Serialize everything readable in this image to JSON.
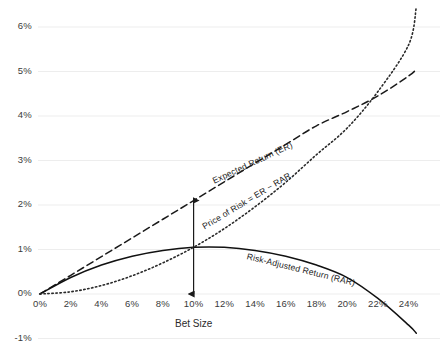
{
  "chart_data": {
    "type": "line",
    "title": "",
    "xlabel": "Bet Size",
    "ylabel": "",
    "xlim": [
      0,
      25
    ],
    "ylim": [
      -1,
      6.5
    ],
    "grid": true,
    "legend_position": "inline-curve-labels",
    "x_ticks": [
      "0%",
      "2%",
      "4%",
      "6%",
      "8%",
      "10%",
      "12%",
      "14%",
      "16%",
      "18%",
      "20%",
      "22%",
      "24%"
    ],
    "x_tick_values": [
      0,
      2,
      4,
      6,
      8,
      10,
      12,
      14,
      16,
      18,
      20,
      22,
      24
    ],
    "y_ticks": [
      "-1%",
      "0%",
      "1%",
      "2%",
      "3%",
      "4%",
      "5%",
      "6%"
    ],
    "y_tick_values": [
      -1,
      0,
      1,
      2,
      3,
      4,
      5,
      6
    ],
    "series": [
      {
        "name": "Expected Return (ER)",
        "style": "dashed",
        "color": "#1a1a1a",
        "x": [
          0,
          2,
          4,
          6,
          8,
          10,
          12,
          14,
          16,
          18,
          20,
          22,
          24,
          24.5
        ],
        "values": [
          0,
          0.42,
          0.84,
          1.26,
          1.68,
          2.1,
          2.52,
          2.94,
          3.36,
          3.78,
          4.1,
          4.45,
          4.9,
          5.05
        ]
      },
      {
        "name": "Risk-Adjusted Return (RAR)",
        "style": "solid",
        "color": "#111111",
        "x": [
          0,
          2,
          4,
          6,
          8,
          10,
          12,
          14,
          16,
          18,
          20,
          22,
          24,
          24.5
        ],
        "values": [
          0,
          0.37,
          0.65,
          0.85,
          0.98,
          1.05,
          1.05,
          0.98,
          0.85,
          0.65,
          0.37,
          -0.1,
          -0.7,
          -0.88
        ]
      },
      {
        "name": "Price of Risk = ER − RAR",
        "style": "dotted",
        "color": "#2a2a2a",
        "x": [
          0,
          2,
          4,
          6,
          8,
          10,
          12,
          14,
          16,
          18,
          20,
          22,
          24,
          24.5
        ],
        "values": [
          0,
          0.05,
          0.19,
          0.41,
          0.7,
          1.05,
          1.47,
          1.96,
          2.51,
          3.13,
          3.73,
          4.55,
          5.6,
          6.45
        ]
      }
    ],
    "annotations": [
      {
        "name": "price-of-risk-arrow",
        "type": "double-arrow",
        "x": 10,
        "y_from": 0,
        "y_to": 2.1
      }
    ]
  },
  "labels": {
    "expected_return": "Expected Return (ER)",
    "price_of_risk": "Price of Risk = ER − RAR",
    "risk_adjusted_return": "Risk-Adjusted Return (RAR)",
    "x_axis_title": "Bet Size"
  },
  "colors": {
    "grid": "#ededed",
    "ink": "#1a1a1a",
    "tick_text": "#3a3a3a"
  }
}
